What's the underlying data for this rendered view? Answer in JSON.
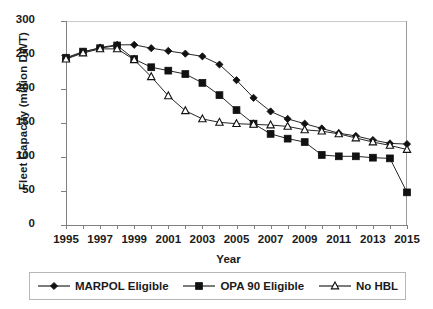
{
  "chart_data": {
    "type": "line",
    "title": "",
    "xlabel": "Year",
    "ylabel": "Fleet Capacity (million DWT)",
    "xlim": [
      1995,
      2015
    ],
    "ylim": [
      0,
      300
    ],
    "yticks": [
      0,
      50,
      100,
      150,
      200,
      250,
      300
    ],
    "xticks": [
      1995,
      1996,
      1997,
      1998,
      1999,
      2000,
      2001,
      2002,
      2003,
      2004,
      2005,
      2006,
      2007,
      2008,
      2009,
      2010,
      2011,
      2012,
      2013,
      2014,
      2015
    ],
    "xtick_labels": [
      "1995",
      "",
      "1997",
      "",
      "1999",
      "",
      "2001",
      "",
      "2003",
      "",
      "2005",
      "",
      "2007",
      "",
      "2009",
      "",
      "2011",
      "",
      "2013",
      "",
      "2015"
    ],
    "grid": false,
    "legend_position": "bottom",
    "x": [
      1995,
      1996,
      1997,
      1998,
      1999,
      2000,
      2001,
      2002,
      2003,
      2004,
      2005,
      2006,
      2007,
      2008,
      2009,
      2010,
      2011,
      2012,
      2013,
      2014,
      2015
    ],
    "series": [
      {
        "name": "MARPOL Eligible",
        "marker": "filled-diamond",
        "color": "#111111",
        "values": [
          245,
          254,
          261,
          265,
          265,
          260,
          256,
          252,
          248,
          236,
          213,
          187,
          167,
          156,
          149,
          142,
          135,
          131,
          125,
          120,
          119
        ]
      },
      {
        "name": "OPA 90 Eligible",
        "marker": "filled-square",
        "color": "#111111",
        "values": [
          246,
          255,
          260,
          264,
          244,
          232,
          227,
          222,
          209,
          191,
          169,
          149,
          134,
          127,
          122,
          103,
          101,
          101,
          99,
          98,
          48
        ]
      },
      {
        "name": "No HBL",
        "marker": "open-triangle",
        "color": "#111111",
        "values": [
          244,
          253,
          259,
          259,
          243,
          218,
          190,
          168,
          156,
          151,
          149,
          148,
          147,
          145,
          140,
          138,
          134,
          128,
          122,
          117,
          111
        ]
      }
    ]
  },
  "legend": {
    "items": [
      {
        "label": "MARPOL Eligible",
        "marker": "filled-diamond"
      },
      {
        "label": "OPA 90 Eligible",
        "marker": "filled-square"
      },
      {
        "label": "No HBL",
        "marker": "open-triangle"
      }
    ]
  },
  "axis": {
    "y_title": "Fleet Capacity (million DWT)",
    "x_title": "Year"
  }
}
